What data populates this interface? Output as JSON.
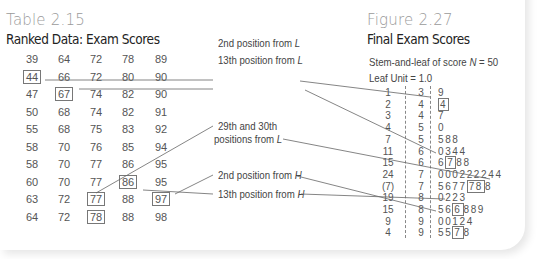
{
  "table": {
    "number": "Table 2.15",
    "title": "Ranked Data: Exam Scores",
    "rows": [
      [
        39,
        64,
        72,
        78,
        89
      ],
      [
        44,
        66,
        72,
        80,
        90
      ],
      [
        47,
        67,
        74,
        82,
        90
      ],
      [
        50,
        68,
        74,
        82,
        91
      ],
      [
        55,
        68,
        75,
        83,
        92
      ],
      [
        58,
        70,
        76,
        85,
        94
      ],
      [
        58,
        70,
        77,
        86,
        95
      ],
      [
        60,
        70,
        77,
        86,
        95
      ],
      [
        63,
        72,
        77,
        88,
        97
      ],
      [
        64,
        72,
        78,
        88,
        98
      ]
    ],
    "boxed_cells": [
      {
        "row": 1,
        "col": 0,
        "value": 44
      },
      {
        "row": 2,
        "col": 1,
        "value": 67
      },
      {
        "row": 7,
        "col": 3,
        "value": 86
      },
      {
        "row": 8,
        "col": 4,
        "value": 97
      },
      {
        "row": 8,
        "col": 2,
        "value": 77
      },
      {
        "row": 9,
        "col": 2,
        "value": 78
      }
    ]
  },
  "annotations": {
    "second_from_L": {
      "text": "2nd position from ",
      "var": "L"
    },
    "thirteenth_from_L": {
      "text": "13th position from ",
      "var": "L"
    },
    "middle_line1": "29th and 30th",
    "middle_line2": {
      "text": "positions from ",
      "var": "L"
    },
    "second_from_H": {
      "text": "2nd position from ",
      "var": "H"
    },
    "thirteenth_from_H": {
      "text": "13th position from ",
      "var": "H"
    }
  },
  "figure": {
    "number": "Figure 2.27",
    "title": "Final Exam Scores",
    "header_line1_text": "Stem-and-leaf of score ",
    "header_line1_var": "N",
    "header_line1_value": " = 50",
    "header_line2": "Leaf Unit = 1.0",
    "rows": [
      {
        "count": "1",
        "stem": "3",
        "leaves": [
          "9"
        ],
        "boxed": []
      },
      {
        "count": "2",
        "stem": "4",
        "leaves": [
          "4"
        ],
        "boxed": [
          0
        ]
      },
      {
        "count": "3",
        "stem": "4",
        "leaves": [
          "7"
        ],
        "boxed": []
      },
      {
        "count": "4",
        "stem": "5",
        "leaves": [
          "0"
        ],
        "boxed": []
      },
      {
        "count": "7",
        "stem": "5",
        "leaves": [
          "5",
          "8",
          "8"
        ],
        "boxed": []
      },
      {
        "count": "11",
        "stem": "6",
        "leaves": [
          "0",
          "3",
          "4",
          "4"
        ],
        "boxed": []
      },
      {
        "count": "15",
        "stem": "6",
        "leaves": [
          "6",
          "7",
          "8",
          "8"
        ],
        "boxed": [
          1
        ]
      },
      {
        "count": "24",
        "stem": "7",
        "leaves": [
          "0",
          "0",
          "0",
          "2",
          "2",
          "2",
          "2",
          "4",
          "4"
        ],
        "boxed": []
      },
      {
        "count": "(7)",
        "stem": "7",
        "leaves": [
          "5",
          "6",
          "7",
          "7",
          "7",
          "8",
          "8"
        ],
        "boxed": [
          4,
          5
        ]
      },
      {
        "count": "19",
        "stem": "8",
        "leaves": [
          "0",
          "2",
          "2",
          "3"
        ],
        "boxed": []
      },
      {
        "count": "15",
        "stem": "8",
        "leaves": [
          "5",
          "6",
          "6",
          "8",
          "8",
          "9"
        ],
        "boxed": [
          2
        ]
      },
      {
        "count": "9",
        "stem": "9",
        "leaves": [
          "0",
          "0",
          "1",
          "2",
          "4"
        ],
        "boxed": []
      },
      {
        "count": "4",
        "stem": "9",
        "leaves": [
          "5",
          "5",
          "7",
          "8"
        ],
        "boxed": [
          2
        ]
      }
    ]
  }
}
